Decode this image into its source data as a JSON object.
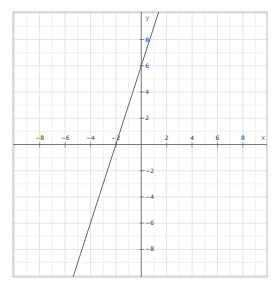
{
  "chart_data": {
    "type": "line",
    "title": "",
    "xlabel": "x",
    "ylabel": "y",
    "xlim": [
      -10.1,
      9.9
    ],
    "ylim": [
      -10.1,
      10.1
    ],
    "grid": true,
    "legend": null,
    "x_ticks": [
      -8,
      -6,
      -4,
      -2,
      2,
      4,
      6,
      8
    ],
    "y_ticks": [
      8,
      6,
      4,
      2,
      -2,
      -4,
      -6,
      -8
    ],
    "series": [
      {
        "name": "y = 3x + 6",
        "equation": "y = 3x + 6",
        "slope": 3,
        "intercept": 6,
        "x": [
          -5.37,
          -2,
          0,
          1.37
        ],
        "y": [
          -10.1,
          0,
          6,
          10.1
        ],
        "color": "#555555"
      }
    ]
  },
  "colors": {
    "background": "#ffffff",
    "border": "#bbbbbb",
    "grid_minor": "#eeeeee",
    "grid_major": "#dddddd",
    "axis": "#555555",
    "line": "#555555"
  },
  "layout": {
    "plot_left": 13,
    "plot_top": 12,
    "plot_right": 267,
    "plot_bottom": 277
  }
}
